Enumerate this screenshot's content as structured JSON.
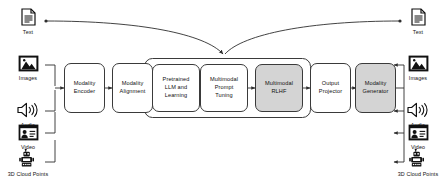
{
  "diagram": {
    "group_frame_label": "llm-training-group",
    "colors": {
      "stroke": "#3a3a3a",
      "shaded_fill": "#d4d4d4",
      "plain_fill": "#ffffff",
      "background": "#ffffff"
    }
  },
  "inputs": [
    {
      "id": "text",
      "label": "Text",
      "icon": "document-icon"
    },
    {
      "id": "images",
      "label": "Images",
      "icon": "image-icon"
    },
    {
      "id": "audio",
      "label": "Audio",
      "icon": "speaker-icon"
    },
    {
      "id": "video",
      "label": "Video",
      "icon": "video-icon"
    },
    {
      "id": "points",
      "label": "3D Cloud Points",
      "icon": "robot-icon"
    }
  ],
  "outputs": [
    {
      "id": "text",
      "label": "Text",
      "icon": "document-icon"
    },
    {
      "id": "images",
      "label": "Images",
      "icon": "image-icon"
    },
    {
      "id": "audio",
      "label": "Audio",
      "icon": "speaker-icon"
    },
    {
      "id": "video",
      "label": "Video",
      "icon": "video-icon"
    },
    {
      "id": "points",
      "label": "3D Cloud Points",
      "icon": "robot-icon"
    }
  ],
  "stages": [
    {
      "id": "modality-encoder",
      "label": "Modality\nEncoder",
      "shaded": false
    },
    {
      "id": "modality-alignment",
      "label": "Modality\nAlignment",
      "shaded": false
    },
    {
      "id": "pretrained-llm",
      "label": "Pretrained\nLLM and\nLearning",
      "shaded": false
    },
    {
      "id": "prompt-tuning",
      "label": "Multimodal\nPrompt\nTuning",
      "shaded": false
    },
    {
      "id": "multimodal-rlhf",
      "label": "Multimodal\nRLHF",
      "shaded": true
    },
    {
      "id": "output-projector",
      "label": "Output\nProjector",
      "shaded": false
    },
    {
      "id": "modality-generator",
      "label": "Modality\nGenerator",
      "shaded": true
    }
  ]
}
